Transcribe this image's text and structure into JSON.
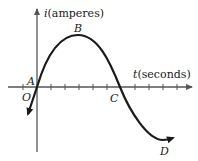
{
  "diagram": {
    "y_axis_label_var": "i",
    "y_axis_label_unit": "(amperes)",
    "x_axis_label_var": "t",
    "x_axis_label_unit": "(seconds)",
    "points": {
      "origin": "O",
      "A": "A",
      "B": "B",
      "C": "C",
      "D": "D"
    },
    "colors": {
      "ink": "#1a1a1a",
      "axis": "#555555",
      "background": "#ffffff"
    }
  }
}
